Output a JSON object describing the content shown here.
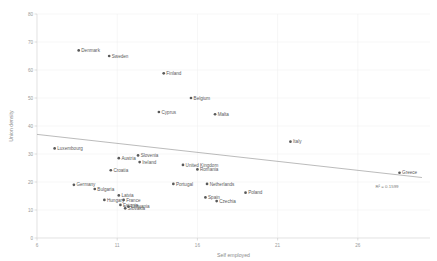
{
  "chart_data": {
    "type": "scatter",
    "title": "",
    "xlabel": "Self employed",
    "ylabel": "Union density",
    "xlim": [
      6,
      30.5
    ],
    "ylim": [
      0,
      80
    ],
    "xticks": [
      6,
      11,
      16,
      21,
      26
    ],
    "yticks": [
      0,
      10,
      20,
      30,
      40,
      50,
      60,
      70,
      80
    ],
    "grid": true,
    "legend": "none",
    "series": [
      {
        "name": "Countries",
        "points": [
          {
            "label": "Denmark",
            "x": 8.6,
            "y": 67.0,
            "label_pos": "right"
          },
          {
            "label": "Sweden",
            "x": 10.5,
            "y": 65.0,
            "label_pos": "right"
          },
          {
            "label": "Finland",
            "x": 13.9,
            "y": 58.8,
            "label_pos": "right"
          },
          {
            "label": "Belgium",
            "x": 15.6,
            "y": 50.0,
            "label_pos": "right"
          },
          {
            "label": "Cyprus",
            "x": 13.6,
            "y": 45.0,
            "label_pos": "right"
          },
          {
            "label": "Malta",
            "x": 17.1,
            "y": 44.2,
            "label_pos": "right"
          },
          {
            "label": "Italy",
            "x": 21.8,
            "y": 34.4,
            "label_pos": "right"
          },
          {
            "label": "Luxembourg",
            "x": 7.1,
            "y": 32.0,
            "label_pos": "right"
          },
          {
            "label": "Austria",
            "x": 11.1,
            "y": 28.5,
            "label_pos": "right"
          },
          {
            "label": "Slovenia",
            "x": 12.3,
            "y": 29.5,
            "label_pos": "right"
          },
          {
            "label": "Ireland",
            "x": 12.4,
            "y": 27.1,
            "label_pos": "right"
          },
          {
            "label": "United Kingdom",
            "x": 15.1,
            "y": 26.1,
            "label_pos": "right"
          },
          {
            "label": "Romania",
            "x": 16.0,
            "y": 24.5,
            "label_pos": "right"
          },
          {
            "label": "Croatia",
            "x": 10.6,
            "y": 24.2,
            "label_pos": "right"
          },
          {
            "label": "Greece",
            "x": 28.6,
            "y": 23.3,
            "label_pos": "right"
          },
          {
            "label": "Germany",
            "x": 8.3,
            "y": 19.0,
            "label_pos": "right"
          },
          {
            "label": "Portugal",
            "x": 14.5,
            "y": 19.3,
            "label_pos": "right"
          },
          {
            "label": "Netherlands",
            "x": 16.6,
            "y": 19.3,
            "label_pos": "right"
          },
          {
            "label": "Bulgaria",
            "x": 9.6,
            "y": 17.5,
            "label_pos": "right"
          },
          {
            "label": "Poland",
            "x": 19.0,
            "y": 16.2,
            "label_pos": "right"
          },
          {
            "label": "Latvia",
            "x": 11.1,
            "y": 15.2,
            "label_pos": "right"
          },
          {
            "label": "Hungary",
            "x": 10.2,
            "y": 13.6,
            "label_pos": "right"
          },
          {
            "label": "France",
            "x": 11.4,
            "y": 13.6,
            "label_pos": "right"
          },
          {
            "label": "Spain",
            "x": 16.5,
            "y": 14.5,
            "label_pos": "right"
          },
          {
            "label": "Czechia",
            "x": 17.2,
            "y": 13.2,
            "label_pos": "right"
          },
          {
            "label": "Estonia",
            "x": 11.2,
            "y": 11.8,
            "label_pos": "right"
          },
          {
            "label": "Lithuania",
            "x": 11.7,
            "y": 11.2,
            "label_pos": "right"
          },
          {
            "label": "Slovakia",
            "x": 11.5,
            "y": 10.6,
            "label_pos": "right"
          }
        ]
      }
    ],
    "trendline": {
      "x_start": 6.0,
      "y_start": 37.0,
      "x_end": 30.0,
      "y_end": 21.6,
      "annotation": "R² = 0.1599"
    }
  },
  "colors": {
    "marker": "#595959",
    "trendline": "#8d8d8d",
    "grid": "#ededed",
    "axis": "#d8d8d8",
    "tick_text": "#9a9a9a",
    "label_text": "#5a5a5a",
    "background": "#ffffff"
  }
}
